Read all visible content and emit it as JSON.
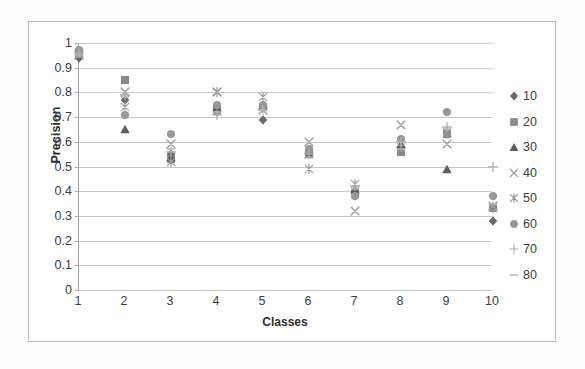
{
  "chart_data": {
    "type": "scatter",
    "title": "",
    "xlabel": "Classes",
    "ylabel": "Precision",
    "xlim": [
      1,
      10
    ],
    "ylim": [
      0,
      1
    ],
    "grid": true,
    "legend_position": "right",
    "categories": [
      "1",
      "2",
      "3",
      "4",
      "5",
      "6",
      "7",
      "8",
      "9",
      "10"
    ],
    "x_tick_labels": [
      "1",
      "2",
      "3",
      "4",
      "5",
      "6",
      "7",
      "8",
      "9",
      "10"
    ],
    "y_tick_labels": [
      "1",
      "0.9",
      "0.8",
      "0.7",
      "0.6",
      "0.5",
      "0.4",
      "0.3",
      "0.2",
      "0.1",
      "0"
    ],
    "y_tick_values": [
      1,
      0.9,
      0.8,
      0.7,
      0.6,
      0.5,
      0.4,
      0.3,
      0.2,
      0.1,
      0
    ],
    "series": [
      {
        "name": "10",
        "marker": "diamond",
        "color": "#6b6b6b",
        "values": [
          0.94,
          0.77,
          0.55,
          0.72,
          0.69,
          0.56,
          0.4,
          0.58,
          0.63,
          0.28
        ]
      },
      {
        "name": "20",
        "marker": "square",
        "color": "#8a8a8a",
        "values": [
          0.96,
          0.85,
          0.53,
          0.73,
          0.74,
          0.56,
          0.39,
          0.56,
          0.63,
          0.33
        ]
      },
      {
        "name": "30",
        "marker": "triangle",
        "color": "#5e5e5e",
        "values": [
          0.95,
          0.65,
          0.54,
          0.74,
          0.75,
          0.55,
          0.41,
          0.59,
          0.49,
          0.34
        ]
      },
      {
        "name": "40",
        "marker": "x-cross",
        "color": "#a6a6a6",
        "values": [
          0.95,
          0.8,
          0.59,
          0.8,
          0.73,
          0.6,
          0.32,
          0.67,
          0.59,
          0.34
        ]
      },
      {
        "name": "50",
        "marker": "asterisk",
        "color": "#9c9c9c",
        "values": [
          0.96,
          0.74,
          0.52,
          0.8,
          0.78,
          0.49,
          0.43,
          0.58,
          0.64,
          0.33
        ]
      },
      {
        "name": "60",
        "marker": "circle",
        "color": "#989898",
        "values": [
          0.97,
          0.71,
          0.63,
          0.75,
          0.75,
          0.57,
          0.38,
          0.61,
          0.72,
          0.38
        ]
      },
      {
        "name": "70",
        "marker": "plus",
        "color": "#b0b0b0",
        "values": [
          0.96,
          0.79,
          0.56,
          0.71,
          0.73,
          0.55,
          0.42,
          0.6,
          0.66,
          0.5
        ]
      },
      {
        "name": "80",
        "marker": "dash",
        "color": "#b5b5b5",
        "values": [
          0.95,
          0.78,
          0.57,
          0.72,
          0.73,
          0.54,
          0.41,
          0.57,
          0.65,
          0.35
        ]
      }
    ]
  },
  "legend": {
    "items": [
      {
        "label": "10",
        "marker": "diamond",
        "color": "#6b6b6b"
      },
      {
        "label": "20",
        "marker": "square",
        "color": "#8a8a8a"
      },
      {
        "label": "30",
        "marker": "triangle",
        "color": "#5e5e5e"
      },
      {
        "label": "40",
        "marker": "x-cross",
        "color": "#a6a6a6"
      },
      {
        "label": "50",
        "marker": "asterisk",
        "color": "#9c9c9c"
      },
      {
        "label": "60",
        "marker": "circle",
        "color": "#989898"
      },
      {
        "label": "70",
        "marker": "plus",
        "color": "#b0b0b0"
      },
      {
        "label": "80",
        "marker": "dash",
        "color": "#b5b5b5"
      }
    ]
  },
  "axes": {
    "y_title": "Precision",
    "x_title": "Classes"
  }
}
